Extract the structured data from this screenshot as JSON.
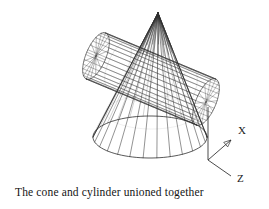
{
  "figure": {
    "caption": "The cone and cylinder unioned together",
    "background_color": "#ffffff",
    "line_color": "#333333",
    "text_color": "#141414"
  },
  "axes": {
    "origin": {
      "x": 208,
      "y": 160
    },
    "items": [
      {
        "name": "x-axis",
        "label": "X",
        "label_x": 238,
        "label_y": 134,
        "tip_x": 231,
        "tip_y": 140,
        "arrow": true
      },
      {
        "name": "y-axis",
        "label": "",
        "label_x": 0,
        "label_y": 0,
        "tip_x": 208,
        "tip_y": 107,
        "arrow": false
      },
      {
        "name": "z-axis",
        "label": "Z",
        "label_x": 237,
        "label_y": 182,
        "tip_x": 231,
        "tip_y": 176,
        "arrow": false
      }
    ]
  },
  "solids": [
    {
      "name": "cone",
      "type": "cone",
      "apex": {
        "x": 158,
        "y": 13
      },
      "base_center": {
        "x": 150,
        "y": 137
      },
      "base_radius_x": 57,
      "base_radius_y": 21,
      "generator_count": 26
    },
    {
      "name": "cylinder",
      "type": "cylinder",
      "cap_a": {
        "x": 96,
        "y": 56
      },
      "cap_b": {
        "x": 206,
        "y": 102
      },
      "radius": 25,
      "cap_radius_minor": 10,
      "mesh_count": 30
    }
  ],
  "boolean_operation": "union"
}
